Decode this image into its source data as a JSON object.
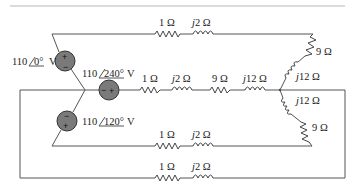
{
  "diagram": {
    "type": "three-phase-circuit",
    "sources": [
      {
        "id": "va",
        "magnitude": "110",
        "angle": "0°",
        "unit": "V",
        "polarity_top": "+",
        "polarity_bottom": "−"
      },
      {
        "id": "vb",
        "magnitude": "110",
        "angle": "240°",
        "unit": "V",
        "polarity_left": "−",
        "polarity_right": "+"
      },
      {
        "id": "vc",
        "magnitude": "110",
        "angle": "120°",
        "unit": "V",
        "polarity_top": "−",
        "polarity_bottom": "+"
      }
    ],
    "line_impedances": {
      "line_a": {
        "r": "1 Ω",
        "x_prefix": "j",
        "x": "2 Ω"
      },
      "line_b": {
        "r": "1 Ω",
        "x_prefix": "j",
        "x": "2 Ω"
      },
      "line_c": {
        "r": "1 Ω",
        "x_prefix": "j",
        "x": "2 Ω"
      },
      "neutral": {
        "r": "1 Ω",
        "x_prefix": "j",
        "x": "2 Ω"
      }
    },
    "load_impedances": {
      "phase_a": {
        "r": "9 Ω",
        "x_prefix": "j",
        "x": "12 Ω"
      },
      "phase_b": {
        "r": "9 Ω",
        "x_prefix": "j",
        "x": "12 Ω"
      },
      "phase_c": {
        "r": "9 Ω",
        "x_prefix": "j",
        "x": "12 Ω"
      }
    }
  }
}
